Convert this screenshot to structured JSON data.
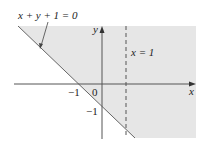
{
  "diagram": {
    "equation_label": "x + y + 1 = 0",
    "vertical_line_label": "x = 1",
    "x_axis_label": "x",
    "y_axis_label": "y",
    "x_tick_label": "−1",
    "origin_label": "0",
    "y_tick_label": "−1",
    "shade_color": "#e6e6e6",
    "line_color": "#555555"
  }
}
